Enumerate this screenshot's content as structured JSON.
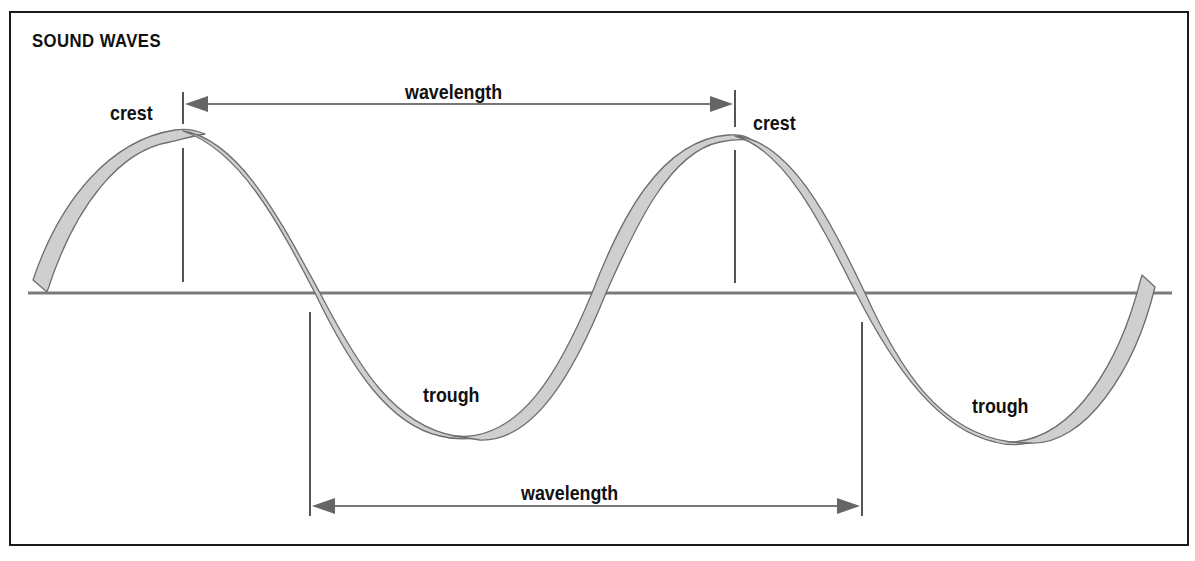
{
  "diagram": {
    "title": "SOUND WAVES",
    "labels": {
      "crest_left": "crest",
      "crest_right": "crest",
      "trough_left": "trough",
      "trough_right": "trough",
      "wavelength_top": "wavelength",
      "wavelength_bottom": "wavelength"
    },
    "colors": {
      "wave_fill": "#cfcfcf",
      "wave_stroke": "#6e6e6e",
      "axis_line": "#7a7a7a",
      "arrow": "#666666",
      "frame": "#1a1a1a",
      "text": "#111111"
    }
  }
}
